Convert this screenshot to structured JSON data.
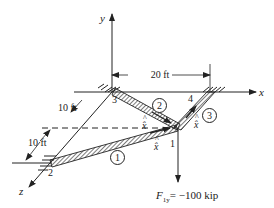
{
  "diagram": {
    "type": "space-truss",
    "axes": {
      "x": "x",
      "y": "y",
      "z": "z"
    },
    "nodes": [
      {
        "id": "1",
        "label": "1"
      },
      {
        "id": "2",
        "label": "2"
      },
      {
        "id": "3",
        "label": "3"
      },
      {
        "id": "4",
        "label": "4"
      }
    ],
    "elements": [
      {
        "id": "1",
        "label": "1",
        "from": "2",
        "to": "1",
        "local_axis": "x̂"
      },
      {
        "id": "2",
        "label": "2",
        "from": "3",
        "to": "1",
        "local_axis": "x̂"
      },
      {
        "id": "3",
        "label": "3",
        "from": "4",
        "to": "1",
        "local_axis": "x̂"
      }
    ],
    "dimensions": [
      {
        "id": "dim-x",
        "label": "20 ft"
      },
      {
        "id": "dim-z-upper",
        "label": "10 ft"
      },
      {
        "id": "dim-z-lower",
        "label": "10 ft"
      }
    ],
    "load": {
      "label": "F",
      "subscript": "1y",
      "value_text": "= −100 kip"
    },
    "colors": {
      "line": "#222222",
      "background": "#ffffff"
    }
  }
}
